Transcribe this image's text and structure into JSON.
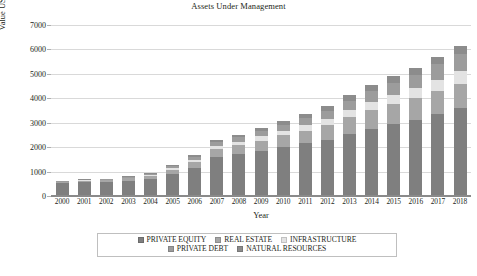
{
  "chart_data": {
    "type": "bar",
    "subtype": "stacked-column",
    "title": "Assets Under Management",
    "xlabel": "Year",
    "ylabel": "Value USD bn",
    "ylim": [
      0,
      7000
    ],
    "yticks": [
      0,
      1000,
      2000,
      3000,
      4000,
      5000,
      6000,
      7000
    ],
    "ytick_labels": [
      "0",
      "1000",
      "2000",
      "3000",
      "4000",
      "5000",
      "6000",
      "7000"
    ],
    "grid": true,
    "legend_position": "bottom",
    "categories": [
      "2000",
      "2001",
      "2002",
      "2003",
      "2004",
      "2005",
      "2006",
      "2007",
      "2008",
      "2009",
      "2010",
      "2011",
      "2012",
      "2013",
      "2014",
      "2015",
      "2016",
      "2017",
      "2018"
    ],
    "series": [
      {
        "name": "PRIVATE EQUITY",
        "color": "#7f7f7f",
        "values": [
          520,
          560,
          570,
          620,
          700,
          900,
          1150,
          1600,
          1700,
          1850,
          2000,
          2150,
          2300,
          2550,
          2750,
          2950,
          3100,
          3350,
          3600
        ]
      },
      {
        "name": "REAL ESTATE",
        "color": "#a6a6a6",
        "values": [
          60,
          70,
          80,
          100,
          130,
          180,
          260,
          340,
          380,
          420,
          480,
          520,
          600,
          680,
          760,
          820,
          900,
          950,
          1000
        ]
      },
      {
        "name": "INFRASTRUCTURE",
        "color": "#e3e3e3",
        "values": [
          10,
          15,
          20,
          25,
          35,
          50,
          80,
          110,
          140,
          170,
          200,
          230,
          270,
          300,
          340,
          380,
          420,
          470,
          520
        ]
      },
      {
        "name": "PRIVATE DEBT",
        "color": "#9c9c9c",
        "values": [
          20,
          25,
          30,
          40,
          55,
          80,
          120,
          160,
          180,
          210,
          240,
          280,
          320,
          380,
          430,
          480,
          540,
          620,
          700
        ]
      },
      {
        "name": "NATURAL RESOURCES",
        "color": "#8c8c8c",
        "values": [
          10,
          10,
          15,
          20,
          30,
          45,
          70,
          100,
          110,
          130,
          150,
          180,
          200,
          230,
          260,
          280,
          300,
          320,
          340
        ]
      }
    ],
    "totals": [
      620,
      680,
      715,
      805,
      950,
      1255,
      1680,
      2310,
      2510,
      2780,
      3070,
      3360,
      3690,
      4140,
      4540,
      4910,
      5260,
      5710,
      6160
    ]
  },
  "legend": {
    "items": [
      {
        "label": "PRIVATE EQUITY"
      },
      {
        "label": "REAL ESTATE"
      },
      {
        "label": "INFRASTRUCTURE"
      },
      {
        "label": "PRIVATE DEBT"
      },
      {
        "label": "NATURAL RESOURCES"
      }
    ]
  }
}
